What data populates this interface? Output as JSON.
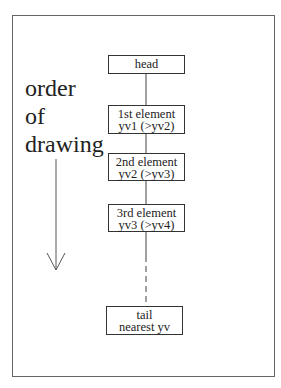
{
  "label": {
    "lines": [
      "order",
      "of",
      "drawing"
    ]
  },
  "nodes": [
    {
      "id": "head",
      "lines": [
        "head"
      ]
    },
    {
      "id": "first",
      "lines": [
        "1st element",
        "yv1 (>yv2)"
      ]
    },
    {
      "id": "second",
      "lines": [
        "2nd element",
        "yv2 (>yv3)"
      ]
    },
    {
      "id": "third",
      "lines": [
        "3rd element",
        "yv3 (>yv4)"
      ]
    },
    {
      "id": "tail",
      "lines": [
        "tail",
        "nearest yv"
      ]
    }
  ],
  "arrow": {
    "direction": "down"
  }
}
